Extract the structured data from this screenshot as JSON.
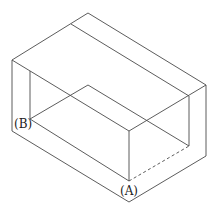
{
  "diagram": {
    "type": "isometric-3d-box-with-notch",
    "stroke_color": "#4a4a4a",
    "labels": {
      "point_a": "(A)",
      "point_b": "(B)"
    },
    "label_positions": {
      "point_a": [
        120,
        195
      ],
      "point_b": [
        14,
        128
      ]
    },
    "solid_edges": [
      [
        12,
        60,
        88,
        13
      ],
      [
        88,
        13,
        206,
        85
      ],
      [
        71,
        24,
        189,
        96
      ],
      [
        12,
        60,
        129,
        131
      ],
      [
        129,
        131,
        206,
        85
      ],
      [
        12,
        60,
        12,
        131
      ],
      [
        206,
        85,
        206,
        156
      ],
      [
        12,
        131,
        129,
        202
      ],
      [
        129,
        202,
        206,
        156
      ],
      [
        30,
        71,
        30,
        119
      ],
      [
        30,
        119,
        88,
        85
      ],
      [
        88,
        85,
        189,
        146
      ],
      [
        189,
        96,
        189,
        146
      ],
      [
        30,
        119,
        129,
        181
      ],
      [
        129,
        131,
        129,
        181
      ]
    ],
    "dashed_edges": [
      [
        129,
        181,
        189,
        146
      ]
    ]
  }
}
